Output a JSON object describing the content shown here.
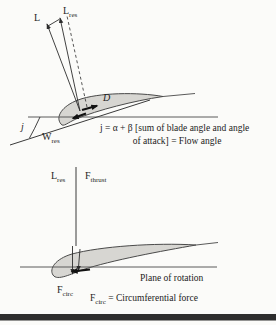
{
  "colors": {
    "line": "#3a3a3a",
    "thick_arrow": "#111111",
    "airfoil_fill": "#d7d6d2",
    "airfoil_stroke": "#4a4a4a",
    "text": "#1f1f1f",
    "bottom_bar": "#2e2e2e",
    "background": "#fbfbf9"
  },
  "top_diagram": {
    "lift_label": "L",
    "lift_res_label": {
      "main": "L",
      "sub": "res"
    },
    "drag_label": "D",
    "flow_angle_label": "j",
    "relative_wind_label": {
      "main": "W",
      "sub": "res"
    },
    "caption_line1": "j = α + β [sum of blade angle and angle",
    "caption_line2": "of attack] = Flow angle"
  },
  "bottom_diagram": {
    "lift_res_label": {
      "main": "L",
      "sub": "res"
    },
    "thrust_label": {
      "main": "F",
      "sub": "thrust"
    },
    "circ_label": {
      "main": "F",
      "sub": "circ"
    },
    "plane_label": "Plane of rotation",
    "caption": {
      "main": "F",
      "sub": "circ",
      "rest": " = Circumferential force"
    }
  }
}
